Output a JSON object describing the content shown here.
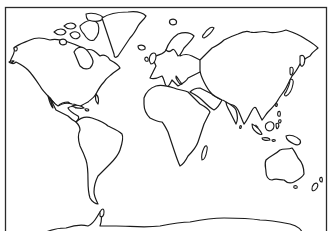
{
  "map": {
    "type": "world-outline",
    "projection": "Mercator-style rectangular",
    "style": "black outline on white, no labels",
    "colors": {
      "background": "#ffffff",
      "outline": "#1a1a1a",
      "frame": "#2a2a2a"
    },
    "regions": [
      "North America",
      "Greenland",
      "Canadian Arctic Archipelago",
      "Central America",
      "Caribbean",
      "South America",
      "Europe",
      "Iceland",
      "British Isles",
      "Scandinavia",
      "Svalbard",
      "Novaya Zemlya",
      "Africa",
      "Madagascar",
      "Arabian Peninsula",
      "Asia",
      "India",
      "Japan",
      "Sakhalin",
      "Southeast Asia",
      "Indonesia",
      "Philippines",
      "New Guinea",
      "Australia",
      "Tasmania",
      "New Zealand",
      "Antarctica"
    ]
  }
}
